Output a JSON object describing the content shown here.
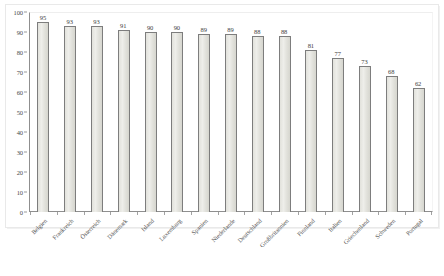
{
  "chart_data": {
    "type": "bar",
    "title": "",
    "subtitle": "",
    "xlabel": "",
    "ylabel": "",
    "categories": [
      "Belgien",
      "Frankreich",
      "Österreich",
      "Dänemark",
      "Island",
      "Luxemburg",
      "Spanien",
      "Niederlande",
      "Deutschland",
      "Großbritannien",
      "Finnland",
      "Italien",
      "Griechenland",
      "Schweden",
      "Portugal"
    ],
    "values": [
      95,
      93,
      93,
      91,
      90,
      90,
      89,
      89,
      88,
      88,
      81,
      77,
      73,
      68,
      62
    ],
    "ylim": [
      0,
      100
    ],
    "ytick_values": [
      0,
      10,
      20,
      30,
      40,
      50,
      60,
      70,
      80,
      90,
      100
    ],
    "ytick_labels": [
      "0",
      "10",
      "20",
      "30",
      "40",
      "50",
      "60",
      "70",
      "80",
      "90",
      "100"
    ],
    "grid": false,
    "legend": null,
    "data_labels": [
      "95",
      "93",
      "93",
      "91",
      "90",
      "90",
      "89",
      "89",
      "88",
      "88",
      "81",
      "77",
      "73",
      "68",
      "62"
    ],
    "bar_fill_color": "#e5e5df",
    "bar_border_color": "#7d7d7d",
    "axis_color": "#8f8f8f",
    "text_color": "#4a4a4a",
    "background_color": "#ffffff"
  }
}
